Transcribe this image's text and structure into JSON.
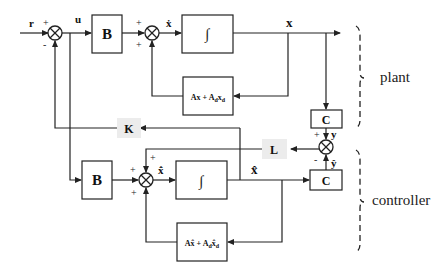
{
  "diagram": {
    "type": "block-diagram",
    "signals": {
      "r": "r",
      "u": "u",
      "x_dot": "ẋ",
      "x": "x",
      "y": "y",
      "x_hat": "x̂",
      "x_hat_dot": "x̂̇",
      "y_hat": "ŷ"
    },
    "plant": {
      "B": "B",
      "integrator": "∫",
      "dynamics": "Ax + A_d x_d",
      "dynamics_main": "Ax + A",
      "dynamics_sub1": "d",
      "dynamics_tail": "x",
      "dynamics_sub2": "d",
      "C": "C"
    },
    "controller": {
      "B": "B",
      "integrator": "∫",
      "dynamics": "Ax̂ + A_d x̂_d",
      "dynamics_main": "Ax̂ + A",
      "dynamics_sub1": "d",
      "dynamics_tail": "x̂",
      "dynamics_sub2": "d",
      "C": "C"
    },
    "gains": {
      "K": "K",
      "L": "L"
    },
    "signs": {
      "sum1_r": "+",
      "sum1_fb": "-",
      "sum2_in": "+",
      "sum2_fb": "+",
      "sum3_y": "+",
      "sum3_yhat": "-",
      "sum4_L": "+",
      "sum4_B": "+",
      "sum4_fb": "+"
    },
    "groups": {
      "plant": "plant",
      "controller": "controller"
    }
  }
}
